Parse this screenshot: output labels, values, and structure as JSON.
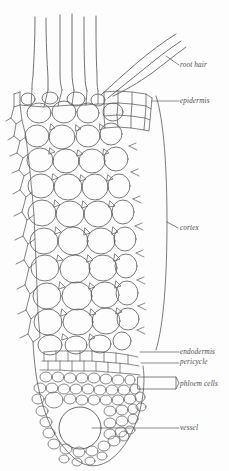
{
  "figure": {
    "style": "line-drawing",
    "background_color": "#fdfdfd",
    "line_color": "#595959",
    "label_color": "#4a4a4a"
  },
  "labels": {
    "root_hair": "root hair",
    "epidermis": "epidermis",
    "cortex": "cortex",
    "endodermis": "endodermis",
    "pericycle": "pericycle",
    "phloem_cells": "phloem cells",
    "vessel": "vessel"
  },
  "structures": [
    {
      "name": "root-hair",
      "label": "root hair",
      "leader": "line",
      "tissue": "epidermal outgrowth",
      "count": 5
    },
    {
      "name": "epidermis",
      "label": "epidermis",
      "leader": "line",
      "tissue": "outer cell layer"
    },
    {
      "name": "cortex",
      "label": "cortex",
      "leader": "brace",
      "tissue": "parenchyma, large rounded cells"
    },
    {
      "name": "endodermis",
      "label": "endodermis",
      "leader": "line",
      "tissue": "inner cortex boundary"
    },
    {
      "name": "pericycle",
      "label": "pericycle",
      "leader": "line",
      "tissue": "outer stele layer"
    },
    {
      "name": "phloem-cells",
      "label": "phloem cells",
      "leader": "box-bracket",
      "tissue": "vascular, small cells"
    },
    {
      "name": "vessel",
      "label": "vessel",
      "leader": "line",
      "tissue": "xylem, large lumen"
    }
  ]
}
